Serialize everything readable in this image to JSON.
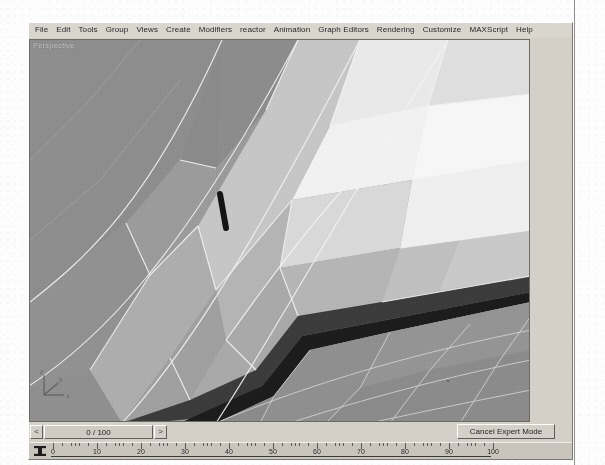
{
  "app": {
    "title": "3ds Max",
    "viewport_label": "Perspective"
  },
  "menu": {
    "items": [
      {
        "label": "File",
        "mnemonic": "F"
      },
      {
        "label": "Edit",
        "mnemonic": "E"
      },
      {
        "label": "Tools",
        "mnemonic": "T"
      },
      {
        "label": "Group",
        "mnemonic": "G"
      },
      {
        "label": "Views",
        "mnemonic": "V"
      },
      {
        "label": "Create",
        "mnemonic": "C"
      },
      {
        "label": "Modifiers",
        "mnemonic": "M"
      },
      {
        "label": "reactor",
        "mnemonic": ""
      },
      {
        "label": "Animation",
        "mnemonic": "A"
      },
      {
        "label": "Graph Editors",
        "mnemonic": "E"
      },
      {
        "label": "Rendering",
        "mnemonic": "R"
      },
      {
        "label": "Customize",
        "mnemonic": "u"
      },
      {
        "label": "MAXScript",
        "mnemonic": "M"
      },
      {
        "label": "Help",
        "mnemonic": "H"
      }
    ]
  },
  "timeslider": {
    "current_frame": 0,
    "total_frames": 100,
    "label": "0 / 100",
    "prev_label": "<",
    "next_label": ">"
  },
  "statusbar": {
    "expert_mode_button": "Cancel Expert Mode"
  },
  "trackbar": {
    "icon": "key-filter-icon",
    "range_start": 0,
    "range_end": 100,
    "tick_labels": [
      "0",
      "10",
      "20",
      "30",
      "40",
      "50",
      "60",
      "70",
      "80",
      "90",
      "100"
    ],
    "tick_values": [
      0,
      10,
      20,
      30,
      40,
      50,
      60,
      70,
      80,
      90,
      100
    ]
  },
  "viewport": {
    "name": "Perspective",
    "shading": "smooth-highlights-wireframe",
    "axis_tripod": {
      "x": "x",
      "y": "y",
      "z": "z"
    },
    "colors": {
      "background": "#9a9a9a",
      "wire": "#f2f2f2",
      "facet_darkest": "#2b2b2b",
      "facet_dark": "#6f6f6f",
      "facet_mid": "#a6a6a6",
      "facet_light": "#d3d3d3",
      "facet_lightest": "#f4f4f4"
    },
    "selected_edge_color": "#1a1a1a"
  },
  "theme": {
    "window_face": "#d4d0c8",
    "menu_face": "#d9d6ce",
    "bevel_light": "#ffffff",
    "bevel_dark": "#6e6a64",
    "text": "#272727"
  }
}
